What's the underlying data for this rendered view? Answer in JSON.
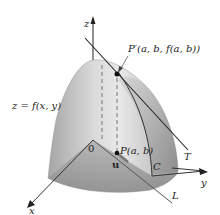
{
  "diagram": {
    "type": "3d-surface-directional-derivative",
    "labels": {
      "z_axis": "z",
      "x_axis": "x",
      "y_axis": "y",
      "origin": "0",
      "surface": "z = f(x, y)",
      "point_on_surface": "P′(a, b, f(a, b))",
      "point_in_plane": "P(a, b)",
      "unit_vector": "u",
      "curve": "C",
      "tangent_line": "T",
      "line_in_plane": "L"
    },
    "colors": {
      "surface_light": "#e6e6e6",
      "surface_mid": "#bdbdbd",
      "surface_dark": "#8f8f8f",
      "lines": "#222222",
      "dashed": "#777777"
    }
  }
}
